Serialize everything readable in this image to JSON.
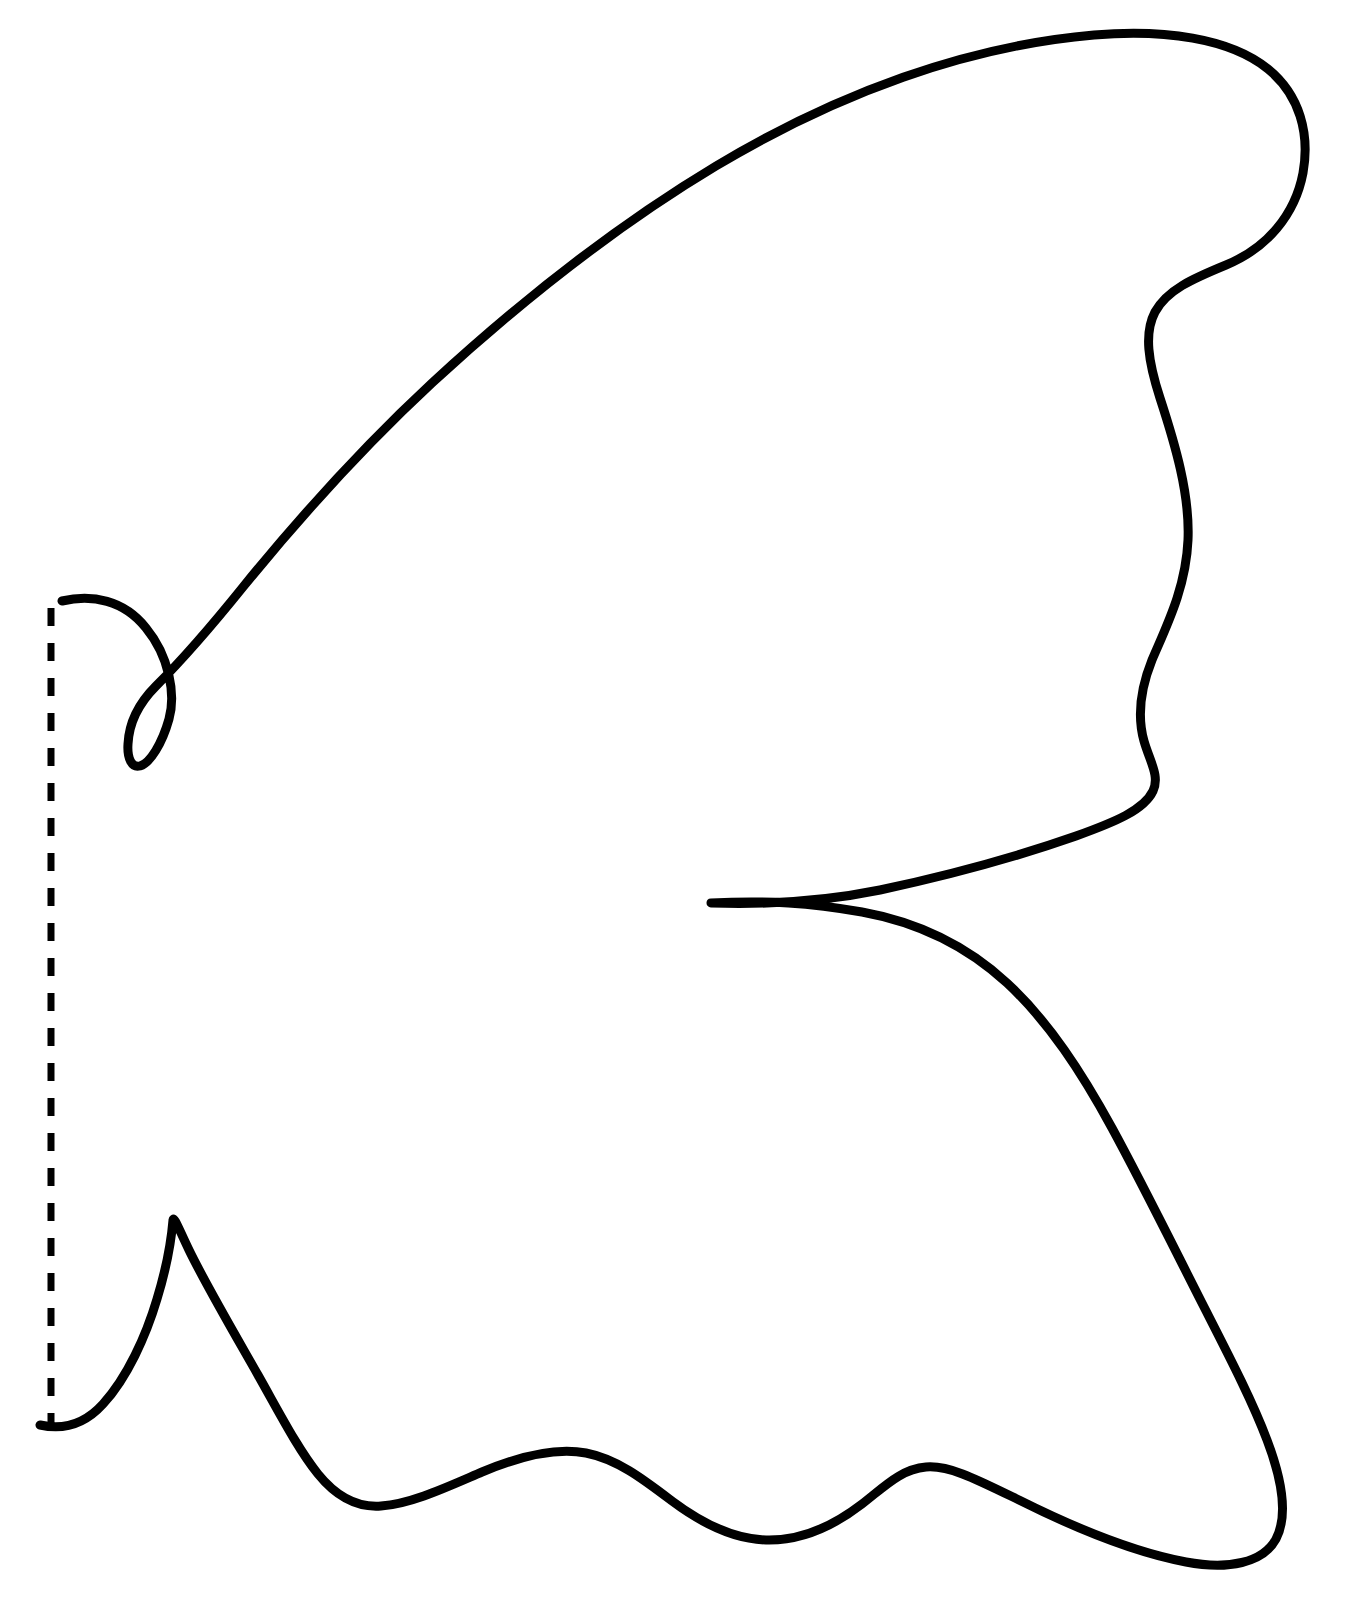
{
  "document": {
    "title": "Butterfly Wing Cutting Template",
    "kind": "line-art-template",
    "background_color": "#ffffff",
    "width": 1360,
    "height": 1601
  },
  "artwork": {
    "name": "wing-outline-template",
    "description": "Single closed black outline of a stylized butterfly wing / fish-tail shape with a scalloped lower edge, a deep V notch at mid-right, a small narrow V notch on the upper left, and a sharp spike on the lower left. A vertical dashed fold line runs along the left edge.",
    "stroke_color": "#000000",
    "fill_color": "none",
    "stroke_width": 9,
    "outline_path": "M 62 601 C 92 594 124 600 146 628 C 169 656 176 694 169 719 C 162 744 150 763 140 766 C 132 768 127 759 128 744 C 129 723 139 703 156 686 C 180 662 210 628 243 587 C 300 517 363 447 432 383 C 520 302 616 226 716 166 C 838 93 967 46 1094 35 C 1163 29 1230 38 1268 69 C 1300 95 1310 134 1303 173 C 1295 215 1267 248 1226 265 C 1192 279 1167 290 1155 312 C 1144 333 1148 361 1160 398 C 1175 444 1190 494 1188 540 C 1186 588 1166 627 1152 660 C 1140 690 1137 716 1144 741 C 1150 762 1160 776 1153 791 C 1144 810 1115 822 1076 836 C 1019 856 950 875 880 890 C 826 901 771 905 711 903 C 768 900 810 903 862 912 C 917 922 967 946 1007 983 C 1049 1022 1082 1073 1112 1128 C 1143 1185 1174 1248 1202 1303 C 1228 1354 1252 1400 1267 1440 C 1283 1482 1288 1516 1276 1539 C 1263 1563 1228 1570 1186 1562 C 1133 1552 1069 1525 1019 1500 C 976 1479 949 1465 926 1467 C 901 1469 884 1487 862 1504 C 836 1524 802 1541 766 1540 C 731 1539 700 1522 672 1501 C 643 1479 617 1459 586 1453 C 555 1447 520 1456 482 1472 C 447 1487 411 1504 381 1506 C 355 1508 335 1495 318 1474 C 298 1449 280 1414 258 1375 C 233 1331 206 1285 189 1250 C 178 1227 174 1216 173 1220 C 172 1232 168 1263 157 1299 C 146 1336 127 1378 103 1404 C 84 1425 62 1430 40 1425",
    "dashed_fold_line": {
      "name": "fold-line",
      "x": 51,
      "y_start": 608,
      "y_end": 1424,
      "stroke_color": "#000000",
      "stroke_width": 7,
      "dash": "18 17"
    }
  },
  "annotations": {
    "scan_artifact_color": "#f2f2f2"
  }
}
